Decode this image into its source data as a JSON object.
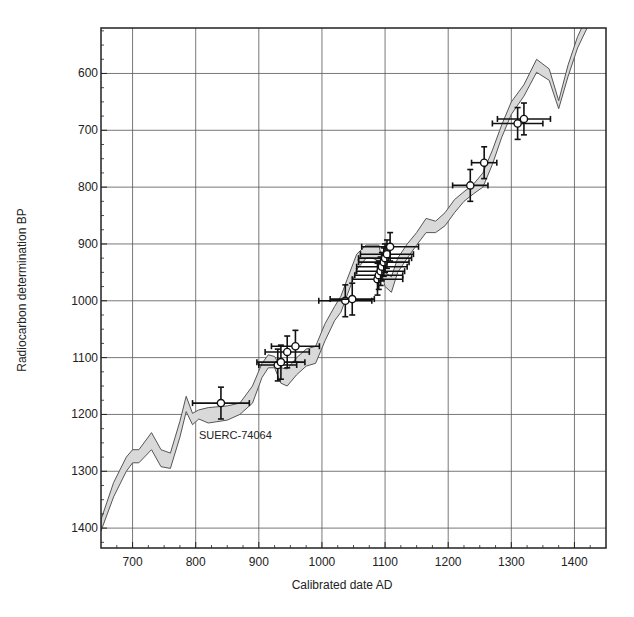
{
  "chart_data": {
    "type": "scatter",
    "title": "",
    "xlabel": "Calibrated date AD",
    "ylabel": "Radiocarbon determination  BP",
    "xlim": [
      650,
      1450
    ],
    "ylim": [
      1435,
      520
    ],
    "y_inverted": true,
    "grid": true,
    "x_ticks": [
      700,
      800,
      900,
      1000,
      1100,
      1200,
      1300,
      1400
    ],
    "y_ticks": [
      600,
      700,
      800,
      900,
      1000,
      1100,
      1200,
      1300,
      1400
    ],
    "annotations": [
      {
        "text": "SUERC-74064",
        "x": 880,
        "y": 1243
      }
    ],
    "calibration_curve": {
      "name": "Calibration curve (1σ band)",
      "x": [
        650,
        670,
        690,
        700,
        710,
        730,
        745,
        760,
        775,
        785,
        795,
        805,
        820,
        850,
        870,
        890,
        905,
        915,
        925,
        935,
        945,
        960,
        975,
        990,
        1005,
        1020,
        1030,
        1040,
        1055,
        1070,
        1080,
        1090,
        1100,
        1110,
        1120,
        1135,
        1150,
        1165,
        1180,
        1195,
        1210,
        1225,
        1240,
        1255,
        1270,
        1285,
        1300,
        1320,
        1340,
        1360,
        1375,
        1390,
        1405,
        1420,
        1430
      ],
      "upper": [
        1385,
        1320,
        1275,
        1262,
        1262,
        1232,
        1262,
        1268,
        1212,
        1168,
        1198,
        1192,
        1188,
        1185,
        1180,
        1150,
        1110,
        1095,
        1098,
        1118,
        1120,
        1100,
        1085,
        1080,
        1040,
        1010,
        992,
        962,
        918,
        902,
        902,
        902,
        950,
        958,
        925,
        900,
        880,
        855,
        860,
        845,
        822,
        808,
        795,
        775,
        735,
        690,
        650,
        620,
        575,
        592,
        648,
        585,
        535,
        500,
        480
      ],
      "lower": [
        1405,
        1345,
        1300,
        1285,
        1285,
        1262,
        1292,
        1295,
        1240,
        1195,
        1218,
        1208,
        1215,
        1210,
        1200,
        1180,
        1135,
        1118,
        1118,
        1145,
        1150,
        1130,
        1115,
        1110,
        1070,
        1035,
        1020,
        990,
        945,
        925,
        925,
        930,
        975,
        985,
        950,
        925,
        902,
        880,
        880,
        868,
        845,
        825,
        812,
        800,
        760,
        712,
        672,
        640,
        598,
        612,
        662,
        605,
        555,
        520,
        500
      ]
    },
    "series": [
      {
        "name": "Dated samples",
        "points": [
          {
            "x": 840,
            "y": 1180,
            "xerr": 45,
            "yerr": 28,
            "label": "SUERC-74064"
          },
          {
            "x": 930,
            "y": 1113,
            "xerr": 30,
            "yerr": 28
          },
          {
            "x": 935,
            "y": 1108,
            "xerr": 38,
            "yerr": 30
          },
          {
            "x": 945,
            "y": 1090,
            "xerr": 35,
            "yerr": 28
          },
          {
            "x": 958,
            "y": 1080,
            "xerr": 38,
            "yerr": 28
          },
          {
            "x": 1037,
            "y": 1000,
            "xerr": 42,
            "yerr": 28
          },
          {
            "x": 1048,
            "y": 997,
            "xerr": 35,
            "yerr": 28
          },
          {
            "x": 1088,
            "y": 962,
            "xerr": 40,
            "yerr": 28
          },
          {
            "x": 1090,
            "y": 955,
            "xerr": 38,
            "yerr": 25
          },
          {
            "x": 1093,
            "y": 948,
            "xerr": 38,
            "yerr": 25
          },
          {
            "x": 1095,
            "y": 940,
            "xerr": 40,
            "yerr": 25
          },
          {
            "x": 1098,
            "y": 932,
            "xerr": 40,
            "yerr": 25
          },
          {
            "x": 1100,
            "y": 925,
            "xerr": 42,
            "yerr": 25
          },
          {
            "x": 1103,
            "y": 918,
            "xerr": 42,
            "yerr": 25
          },
          {
            "x": 1108,
            "y": 905,
            "xerr": 45,
            "yerr": 25
          },
          {
            "x": 1235,
            "y": 797,
            "xerr": 28,
            "yerr": 28
          },
          {
            "x": 1257,
            "y": 757,
            "xerr": 20,
            "yerr": 28
          },
          {
            "x": 1310,
            "y": 688,
            "xerr": 40,
            "yerr": 28
          },
          {
            "x": 1320,
            "y": 680,
            "xerr": 42,
            "yerr": 28
          }
        ]
      }
    ]
  }
}
